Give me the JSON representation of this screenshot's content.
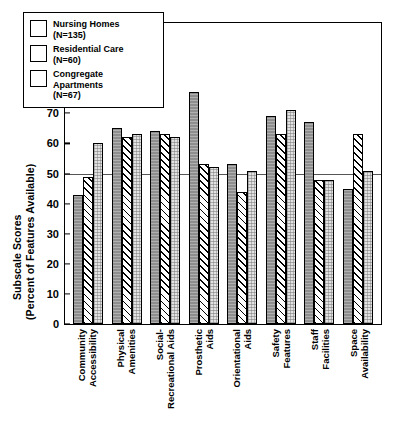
{
  "chart_data": {
    "type": "bar",
    "title": "",
    "xlabel": "",
    "ylabel_line1": "Subscale Scores",
    "ylabel_line2": "(Percent of Features Available)",
    "ylim": [
      0,
      100
    ],
    "yticks": [
      0,
      10,
      20,
      30,
      40,
      50,
      60,
      70,
      80,
      90,
      100
    ],
    "gridlines": [
      "50"
    ],
    "legend_position": "upper-left-inside",
    "categories": [
      "Community Accessibility",
      "Physical Amenities",
      "Social-Recreational Aids",
      "Prosthetic Aids",
      "Orientational Aids",
      "Safety Features",
      "Staff Facilities",
      "Space Availability"
    ],
    "category_lines": [
      [
        "Community",
        "Accessibility"
      ],
      [
        "Physical",
        "Amenities"
      ],
      [
        "Social-",
        "Recreational Aids"
      ],
      [
        "Prosthetic",
        "Aids"
      ],
      [
        "Orientational",
        "Aids"
      ],
      [
        "Safety",
        "Features"
      ],
      [
        "Staff",
        "Facilities"
      ],
      [
        "Space",
        "Availability"
      ]
    ],
    "series": [
      {
        "name": "Nursing Homes",
        "n_label": "(N=135)",
        "pattern": "solid-gray",
        "color": "#8e8e8e",
        "values": [
          43,
          65,
          64,
          77,
          53,
          69,
          67,
          45
        ]
      },
      {
        "name": "Residential Care",
        "n_label": "(N=60)",
        "pattern": "diagonal-hatch",
        "color": "#ffffff",
        "values": [
          49,
          62,
          63,
          53,
          44,
          63,
          48,
          63
        ]
      },
      {
        "name": "Congregate Apartments",
        "n_label": "(N=67)",
        "pattern": "light-dotted",
        "color": "#e2e2e2",
        "values": [
          60,
          63,
          62,
          52,
          51,
          71,
          48,
          51
        ]
      }
    ]
  },
  "legend": {
    "entries": [
      {
        "label": "Nursing Homes",
        "sub": "(N=135)"
      },
      {
        "label": "Residential Care",
        "sub": "(N=60)"
      },
      {
        "label_line1": "Congregate",
        "label_line2": "Apartments",
        "sub": "(N=67)"
      }
    ]
  },
  "axis": {
    "y_title_line1": "Subscale Scores",
    "y_title_line2": "(Percent of Features Available)",
    "ytick_labels": [
      "100",
      "90",
      "80",
      "70",
      "60",
      "50",
      "40",
      "30",
      "20",
      "10",
      "0"
    ]
  }
}
